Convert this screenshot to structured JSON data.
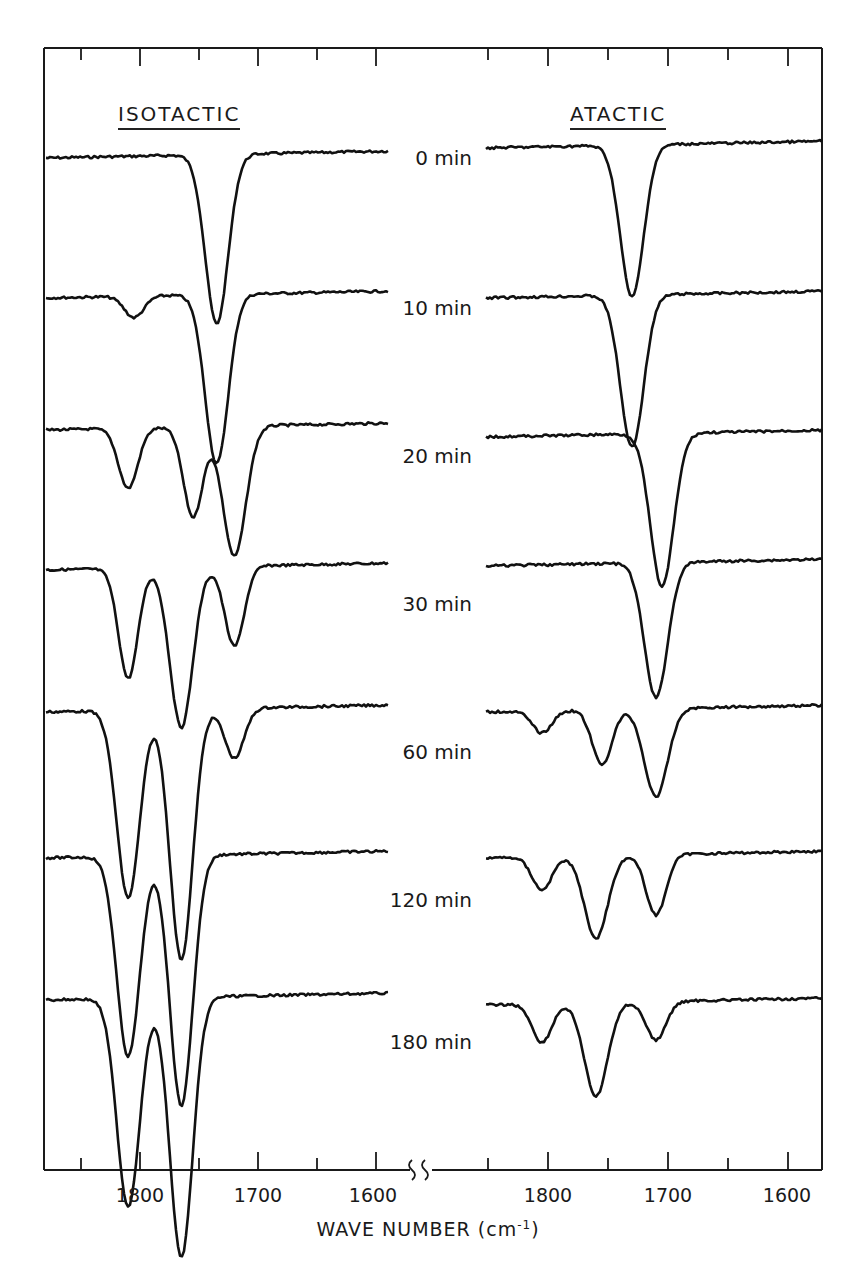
{
  "chart_data": {
    "type": "line",
    "title": "",
    "xlabel": "WAVE NUMBER (cm-1)",
    "ylabel": "",
    "panels": [
      {
        "name": "ISOTACTIC",
        "xlim": [
          1850,
          1590
        ],
        "xticks": [
          1800,
          1700,
          1600
        ],
        "minor_xticks": [
          1850,
          1750,
          1650
        ],
        "series": [
          {
            "name": "0 min",
            "bands": [
              {
                "center": 1735,
                "depth": 0.95
              }
            ]
          },
          {
            "name": "10 min",
            "bands": [
              {
                "center": 1805,
                "depth": 0.12
              },
              {
                "center": 1735,
                "depth": 0.95
              }
            ]
          },
          {
            "name": "20 min",
            "bands": [
              {
                "center": 1810,
                "depth": 0.3
              },
              {
                "center": 1755,
                "depth": 0.45
              },
              {
                "center": 1720,
                "depth": 0.65
              }
            ]
          },
          {
            "name": "30 min",
            "bands": [
              {
                "center": 1810,
                "depth": 0.55
              },
              {
                "center": 1765,
                "depth": 0.8
              },
              {
                "center": 1720,
                "depth": 0.4
              }
            ]
          },
          {
            "name": "60 min",
            "bands": [
              {
                "center": 1810,
                "depth": 0.75
              },
              {
                "center": 1765,
                "depth": 1.0
              },
              {
                "center": 1720,
                "depth": 0.2
              }
            ]
          },
          {
            "name": "120 min",
            "bands": [
              {
                "center": 1810,
                "depth": 0.8
              },
              {
                "center": 1765,
                "depth": 1.0
              }
            ]
          },
          {
            "name": "180 min",
            "bands": [
              {
                "center": 1810,
                "depth": 0.8
              },
              {
                "center": 1765,
                "depth": 1.0
              }
            ]
          }
        ]
      },
      {
        "name": "ATACTIC",
        "xlim": [
          1850,
          1590
        ],
        "xticks": [
          1800,
          1700,
          1600
        ],
        "minor_xticks": [
          1850,
          1750,
          1650
        ],
        "series": [
          {
            "name": "0 min",
            "bands": [
              {
                "center": 1730,
                "depth": 0.95
              }
            ]
          },
          {
            "name": "10 min",
            "bands": [
              {
                "center": 1730,
                "depth": 0.95
              }
            ]
          },
          {
            "name": "20 min",
            "bands": [
              {
                "center": 1705,
                "depth": 0.9
              }
            ]
          },
          {
            "name": "30 min",
            "bands": [
              {
                "center": 1710,
                "depth": 0.9
              }
            ]
          },
          {
            "name": "60 min",
            "bands": [
              {
                "center": 1805,
                "depth": 0.2
              },
              {
                "center": 1755,
                "depth": 0.5
              },
              {
                "center": 1710,
                "depth": 0.8
              }
            ]
          },
          {
            "name": "120 min",
            "bands": [
              {
                "center": 1805,
                "depth": 0.3
              },
              {
                "center": 1760,
                "depth": 0.75
              },
              {
                "center": 1710,
                "depth": 0.55
              }
            ]
          },
          {
            "name": "180 min",
            "bands": [
              {
                "center": 1805,
                "depth": 0.35
              },
              {
                "center": 1760,
                "depth": 0.85
              },
              {
                "center": 1710,
                "depth": 0.35
              }
            ]
          }
        ]
      }
    ],
    "time_labels": [
      "0 min",
      "10 min",
      "20 min",
      "30 min",
      "60 min",
      "120 min",
      "180 min"
    ],
    "axis_break": true,
    "grid": false,
    "legend": "none"
  },
  "panels": {
    "left_title": "ISOTACTIC",
    "right_title": "ATACTIC"
  },
  "time_labels": [
    "0 min",
    "10 min",
    "20 min",
    "30 min",
    "60 min",
    "120 min",
    "180 min"
  ],
  "x_axis": {
    "left_ticks": [
      "1800",
      "1700",
      "1600"
    ],
    "right_ticks": [
      "1800",
      "1700",
      "1600"
    ],
    "title_main": "WAVE NUMBER (cm",
    "title_sup": "-1",
    "title_end": ")"
  },
  "caption_fragment": "……………………… ……… ………… ……. ……………… ……………… …… ……… ….. ……….."
}
